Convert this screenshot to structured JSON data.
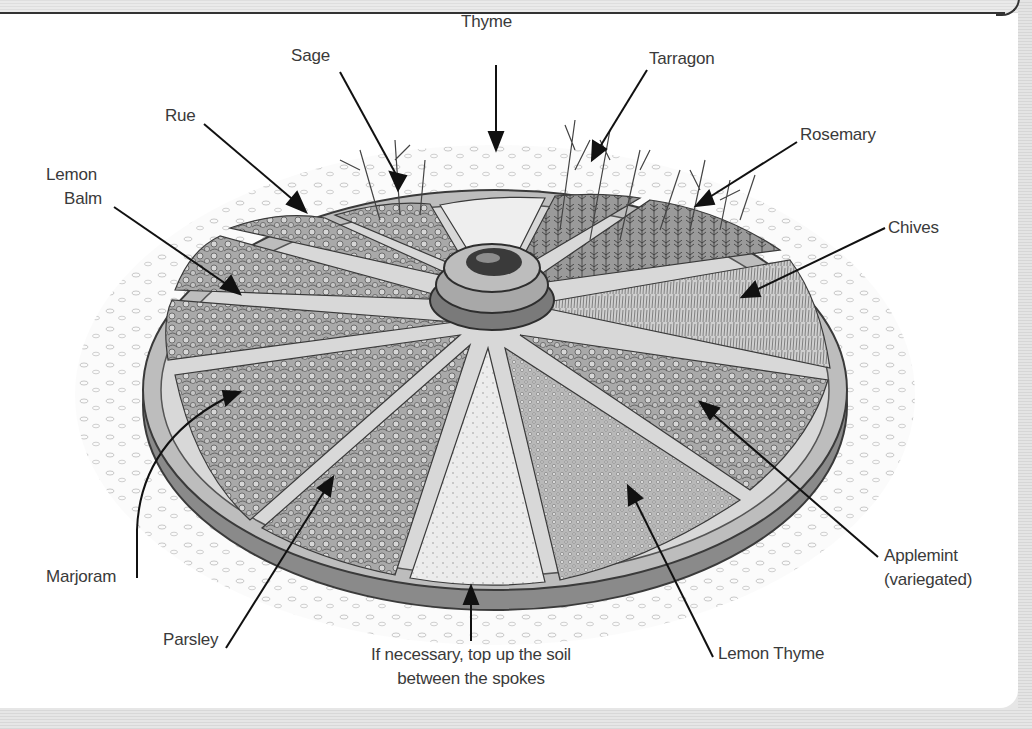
{
  "illustration": {
    "subject": "herb-wheel-garden",
    "centerpiece": "cartwheel-hub"
  },
  "labels": {
    "sage": "Sage",
    "thyme": "Thyme",
    "tarragon": "Tarragon",
    "rue": "Rue",
    "rosemary": "Rosemary",
    "lemon_balm_1": "Lemon",
    "lemon_balm_2": "Balm",
    "chives": "Chives",
    "marjoram": "Marjoram",
    "applemint_1": "Applemint",
    "applemint_2": "(variegated)",
    "parsley": "Parsley",
    "lemon_thyme": "Lemon Thyme",
    "note_1": "If necessary, top up the soil",
    "note_2": "between the spokes"
  }
}
